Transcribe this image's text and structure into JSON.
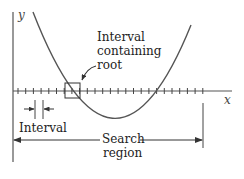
{
  "diagram": {
    "axes": {
      "x_label": "x",
      "y_label": "y"
    },
    "labels": {
      "root_interval_line1": "Interval",
      "root_interval_line2": "containing",
      "root_interval_line3": "root",
      "interval": "Interval",
      "search_region_line1": "Search",
      "search_region_line2": "region"
    },
    "colors": {
      "axis": "#555555",
      "curve": "#555555",
      "text": "#222222",
      "background": "#ffffff"
    },
    "ticks": {
      "count": 25,
      "start_x": 18,
      "spacing": 7.7
    }
  }
}
